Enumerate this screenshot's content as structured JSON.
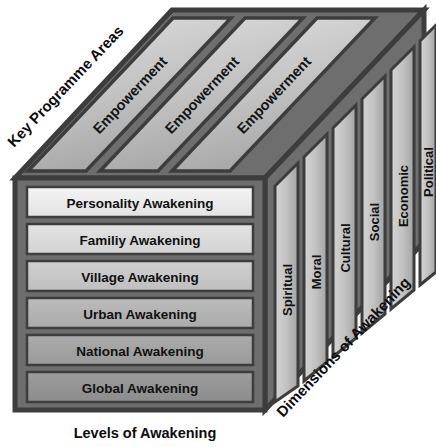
{
  "diagram": {
    "title_axes": {
      "top_left_axis": "Key Programme Areas",
      "bottom_axis": "Levels of  Awakening",
      "right_axis": "Dimensions of Awakening"
    },
    "top_face": {
      "panels": [
        {
          "label": "Empowerment"
        },
        {
          "label": "Empowerment"
        },
        {
          "label": "Empowerment"
        }
      ]
    },
    "front_face": {
      "levels": [
        {
          "label": "Personality Awakening",
          "fill": "#ededed"
        },
        {
          "label": "Familiy Awakening",
          "fill": "#dcdcdc"
        },
        {
          "label": "Village Awakening",
          "fill": "#c9c9c9"
        },
        {
          "label": "Urban Awakening",
          "fill": "#b4b4b4"
        },
        {
          "label": "National Awakening",
          "fill": "#a3a3a3"
        },
        {
          "label": "Global Awakening",
          "fill": "#949494"
        }
      ]
    },
    "right_face": {
      "dimensions": [
        {
          "label": "Spiritual"
        },
        {
          "label": "Moral"
        },
        {
          "label": "Cultural"
        },
        {
          "label": "Social"
        },
        {
          "label": "Economic"
        },
        {
          "label": "Political"
        }
      ]
    },
    "colors": {
      "outline": "#3d3d3d",
      "top_panel_light": "#d8d8d8",
      "top_panel_dark": "#a8a8a8",
      "side_panel_light": "#d2d2d2",
      "side_panel_dark": "#9a9a9a",
      "background": "#ffffff",
      "text": "#111111"
    }
  }
}
